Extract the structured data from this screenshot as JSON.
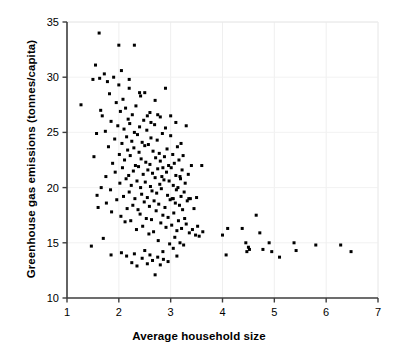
{
  "chart_data": {
    "type": "scatter",
    "title": "",
    "xlabel": "Average household size",
    "ylabel": "Greenhouse gas emissions (tonnes/capita)",
    "xlim": [
      1,
      7
    ],
    "ylim": [
      10,
      35
    ],
    "xticks": [
      1,
      2,
      3,
      4,
      5,
      6,
      7
    ],
    "yticks": [
      10,
      15,
      20,
      25,
      30,
      35
    ],
    "xtick_labels": [
      "1",
      "2",
      "3",
      "4",
      "5",
      "6",
      "7"
    ],
    "ytick_labels": [
      "10",
      "15",
      "20",
      "25",
      "30",
      "35"
    ],
    "grid": "faint-light-gray",
    "legend": "none",
    "marker": "square",
    "marker_color": "#000000",
    "marker_size_px": 3,
    "series": [
      {
        "name": "Regions",
        "points": [
          [
            1.27,
            27.5
          ],
          [
            1.47,
            14.7
          ],
          [
            1.5,
            29.8
          ],
          [
            1.52,
            22.8
          ],
          [
            1.55,
            31.1
          ],
          [
            1.57,
            24.9
          ],
          [
            1.58,
            19.3
          ],
          [
            1.6,
            18.2
          ],
          [
            1.62,
            34.0
          ],
          [
            1.63,
            29.9
          ],
          [
            1.65,
            27.0
          ],
          [
            1.66,
            20.0
          ],
          [
            1.68,
            26.5
          ],
          [
            1.7,
            15.4
          ],
          [
            1.72,
            30.3
          ],
          [
            1.74,
            25.1
          ],
          [
            1.75,
            21.0
          ],
          [
            1.76,
            18.6
          ],
          [
            1.78,
            29.6
          ],
          [
            1.8,
            23.7
          ],
          [
            1.82,
            28.5
          ],
          [
            1.84,
            19.8
          ],
          [
            1.85,
            26.0
          ],
          [
            1.86,
            17.8
          ],
          [
            1.88,
            22.2
          ],
          [
            1.9,
            30.0
          ],
          [
            1.92,
            24.4
          ],
          [
            1.93,
            21.4
          ],
          [
            1.95,
            27.7
          ],
          [
            1.96,
            18.9
          ],
          [
            1.98,
            25.6
          ],
          [
            2.0,
            32.9
          ],
          [
            2.0,
            29.3
          ],
          [
            2.01,
            23.0
          ],
          [
            2.02,
            20.4
          ],
          [
            2.03,
            26.9
          ],
          [
            2.04,
            17.4
          ],
          [
            2.05,
            30.6
          ],
          [
            2.06,
            24.0
          ],
          [
            2.07,
            21.8
          ],
          [
            2.08,
            28.0
          ],
          [
            2.09,
            19.2
          ],
          [
            2.1,
            25.3
          ],
          [
            2.11,
            22.5
          ],
          [
            2.12,
            16.9
          ],
          [
            2.13,
            27.2
          ],
          [
            2.14,
            20.8
          ],
          [
            2.15,
            24.6
          ],
          [
            2.16,
            18.1
          ],
          [
            2.17,
            23.4
          ],
          [
            2.18,
            26.2
          ],
          [
            2.19,
            21.1
          ],
          [
            2.2,
            29.0
          ],
          [
            2.2,
            19.6
          ],
          [
            2.21,
            25.8
          ],
          [
            2.22,
            22.9
          ],
          [
            2.23,
            17.0
          ],
          [
            2.24,
            20.2
          ],
          [
            2.25,
            24.2
          ],
          [
            2.26,
            26.6
          ],
          [
            2.27,
            18.4
          ],
          [
            2.28,
            21.5
          ],
          [
            2.29,
            23.6
          ],
          [
            2.3,
            32.9
          ],
          [
            2.3,
            25.0
          ],
          [
            2.31,
            19.0
          ],
          [
            2.32,
            22.0
          ],
          [
            2.33,
            27.4
          ],
          [
            2.34,
            16.2
          ],
          [
            2.35,
            20.6
          ],
          [
            2.36,
            24.8
          ],
          [
            2.37,
            18.0
          ],
          [
            2.38,
            21.9
          ],
          [
            2.39,
            23.2
          ],
          [
            2.4,
            28.6
          ],
          [
            2.4,
            25.5
          ],
          [
            2.41,
            17.6
          ],
          [
            2.42,
            20.0
          ],
          [
            2.43,
            22.6
          ],
          [
            2.44,
            19.4
          ],
          [
            2.45,
            24.1
          ],
          [
            2.46,
            16.5
          ],
          [
            2.47,
            21.2
          ],
          [
            2.48,
            26.1
          ],
          [
            2.49,
            18.7
          ],
          [
            2.5,
            28.6
          ],
          [
            2.5,
            23.8
          ],
          [
            2.51,
            20.5
          ],
          [
            2.52,
            22.3
          ],
          [
            2.53,
            17.2
          ],
          [
            2.54,
            25.2
          ],
          [
            2.55,
            19.1
          ],
          [
            2.56,
            21.6
          ],
          [
            2.57,
            23.9
          ],
          [
            2.58,
            15.8
          ],
          [
            2.59,
            18.3
          ],
          [
            2.6,
            26.8
          ],
          [
            2.6,
            22.1
          ],
          [
            2.61,
            20.1
          ],
          [
            2.62,
            24.5
          ],
          [
            2.63,
            17.1
          ],
          [
            2.64,
            19.7
          ],
          [
            2.65,
            21.3
          ],
          [
            2.66,
            23.3
          ],
          [
            2.67,
            16.0
          ],
          [
            2.68,
            18.8
          ],
          [
            2.69,
            25.7
          ],
          [
            2.7,
            27.9
          ],
          [
            2.7,
            20.9
          ],
          [
            2.71,
            22.7
          ],
          [
            2.72,
            17.9
          ],
          [
            2.73,
            19.5
          ],
          [
            2.74,
            24.3
          ],
          [
            2.75,
            21.7
          ],
          [
            2.76,
            15.2
          ],
          [
            2.77,
            18.5
          ],
          [
            2.78,
            23.1
          ],
          [
            2.79,
            20.3
          ],
          [
            2.8,
            26.4
          ],
          [
            2.8,
            22.4
          ],
          [
            2.81,
            16.8
          ],
          [
            2.82,
            19.9
          ],
          [
            2.83,
            21.0
          ],
          [
            2.84,
            24.9
          ],
          [
            2.85,
            17.5
          ],
          [
            2.86,
            13.5
          ],
          [
            2.87,
            20.7
          ],
          [
            2.88,
            22.8
          ],
          [
            2.89,
            18.2
          ],
          [
            2.9,
            29.0
          ],
          [
            2.9,
            25.4
          ],
          [
            2.91,
            16.4
          ],
          [
            2.92,
            21.4
          ],
          [
            2.93,
            23.5
          ],
          [
            2.94,
            19.3
          ],
          [
            2.95,
            17.3
          ],
          [
            2.96,
            22.0
          ],
          [
            2.97,
            20.6
          ],
          [
            2.98,
            14.9
          ],
          [
            2.99,
            18.9
          ],
          [
            3.0,
            26.5
          ],
          [
            3.0,
            24.7
          ],
          [
            3.01,
            21.8
          ],
          [
            3.02,
            16.6
          ],
          [
            3.03,
            19.0
          ],
          [
            3.04,
            23.0
          ],
          [
            3.05,
            20.2
          ],
          [
            3.06,
            17.7
          ],
          [
            3.07,
            22.2
          ],
          [
            3.08,
            15.5
          ],
          [
            3.09,
            18.6
          ],
          [
            3.1,
            25.9
          ],
          [
            3.1,
            21.1
          ],
          [
            3.11,
            19.8
          ],
          [
            3.12,
            16.1
          ],
          [
            3.13,
            23.7
          ],
          [
            3.14,
            20.0
          ],
          [
            3.15,
            17.0
          ],
          [
            3.16,
            22.5
          ],
          [
            3.17,
            18.4
          ],
          [
            3.18,
            15.0
          ],
          [
            3.19,
            20.8
          ],
          [
            3.2,
            24.0
          ],
          [
            3.2,
            19.2
          ],
          [
            3.21,
            16.3
          ],
          [
            3.22,
            21.6
          ],
          [
            3.23,
            18.0
          ],
          [
            3.24,
            22.9
          ],
          [
            3.25,
            14.8
          ],
          [
            3.26,
            19.6
          ],
          [
            3.27,
            17.2
          ],
          [
            3.28,
            20.4
          ],
          [
            3.3,
            25.6
          ],
          [
            3.3,
            16.7
          ],
          [
            3.32,
            18.8
          ],
          [
            3.34,
            21.2
          ],
          [
            3.36,
            15.9
          ],
          [
            3.38,
            19.0
          ],
          [
            3.4,
            22.0
          ],
          [
            3.42,
            16.2
          ],
          [
            3.45,
            18.1
          ],
          [
            3.48,
            15.7
          ],
          [
            3.5,
            19.1
          ],
          [
            3.52,
            16.5
          ],
          [
            3.55,
            15.6
          ],
          [
            3.6,
            22.0
          ],
          [
            3.62,
            16.0
          ],
          [
            1.85,
            13.9
          ],
          [
            2.05,
            14.1
          ],
          [
            2.15,
            13.8
          ],
          [
            2.25,
            13.2
          ],
          [
            2.3,
            14.0
          ],
          [
            2.35,
            12.9
          ],
          [
            2.45,
            13.6
          ],
          [
            2.5,
            14.3
          ],
          [
            2.55,
            13.1
          ],
          [
            2.6,
            13.9
          ],
          [
            2.65,
            13.4
          ],
          [
            2.7,
            12.1
          ],
          [
            2.75,
            13.7
          ],
          [
            2.8,
            13.0
          ],
          [
            2.85,
            14.2
          ],
          [
            2.95,
            13.3
          ],
          [
            3.05,
            14.5
          ],
          [
            3.12,
            13.8
          ],
          [
            2.2,
            29.8
          ],
          [
            2.42,
            28.3
          ],
          [
            2.55,
            26.5
          ],
          [
            2.62,
            25.9
          ],
          [
            2.75,
            26.6
          ],
          [
            2.85,
            21.8
          ],
          [
            3.05,
            19.0
          ],
          [
            3.18,
            21.0
          ],
          [
            3.35,
            19.0
          ],
          [
            4.0,
            15.7
          ],
          [
            4.07,
            13.9
          ],
          [
            4.1,
            16.3
          ],
          [
            4.38,
            16.3
          ],
          [
            4.45,
            15.0
          ],
          [
            4.47,
            14.2
          ],
          [
            4.5,
            14.6
          ],
          [
            4.52,
            14.4
          ],
          [
            4.65,
            17.5
          ],
          [
            4.72,
            15.9
          ],
          [
            4.78,
            14.4
          ],
          [
            4.9,
            15.0
          ],
          [
            4.95,
            14.2
          ],
          [
            5.1,
            13.7
          ],
          [
            5.38,
            15.0
          ],
          [
            5.42,
            14.3
          ],
          [
            5.8,
            14.8
          ],
          [
            6.28,
            14.8
          ],
          [
            6.48,
            14.2
          ]
        ]
      }
    ]
  }
}
